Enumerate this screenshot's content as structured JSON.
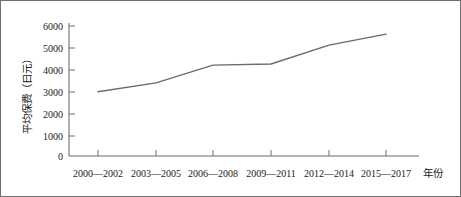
{
  "chart_data": {
    "type": "line",
    "title": "",
    "subtitle": "",
    "xlabel": "年份",
    "ylabel": "平均保费（日元）",
    "categories": [
      "2000—2002",
      "2003—2005",
      "2006—2008",
      "2009—2011",
      "2012—2014",
      "2015—2017"
    ],
    "values": [
      2900,
      3300,
      4100,
      4150,
      5000,
      5500
    ],
    "series": [
      {
        "name": "平均保费",
        "values": [
          2900,
          3300,
          4100,
          4150,
          5000,
          5500
        ]
      }
    ],
    "ylim": [
      0,
      6000
    ],
    "ytick_labels": [
      "0",
      "1000",
      "2000",
      "3000",
      "4000",
      "5000",
      "6000"
    ],
    "ytick_values": [
      0,
      1000,
      2000,
      3000,
      4000,
      5000,
      6000
    ],
    "grid": false,
    "legend": false,
    "legend_position": "none",
    "markers": false,
    "line_color": "#6b6b6b",
    "axis_color": "#6f6f6f",
    "background_color": "#ffffff",
    "border_color": "#6f6f6f"
  },
  "axis": {
    "y_title": "平均保费（日元）",
    "x_title": "年份"
  }
}
